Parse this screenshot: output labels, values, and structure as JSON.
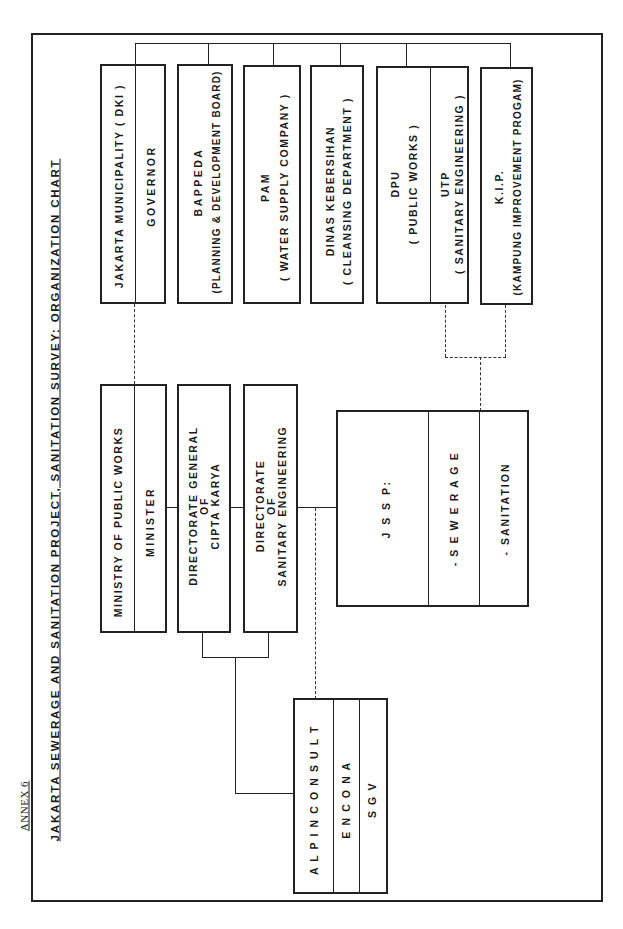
{
  "document": {
    "annex_label": "ANNEX 6",
    "title": "JAKARTA  SEWERAGE  AND  SANITATION  PROJECT, SANITATION  SURVEY: ORGANIZATION  CHART"
  },
  "chart": {
    "orientation": "rotated 90° counter-clockwise",
    "top_row_agencies": [
      {
        "id": "dki",
        "line1": "JAKARTA  MUNICIPALITY  ( DKI )",
        "line2": "GOVERNOR"
      },
      {
        "id": "bappeda",
        "line1": "BAPPEDA",
        "line2": "(PLANNING & DEVELOPMENT BOARD)"
      },
      {
        "id": "pam",
        "line1": "PAM",
        "line2": "( WATER  SUPPLY  COMPANY )"
      },
      {
        "id": "dinas",
        "line1": "DINAS  KEBERSIHAN",
        "line2": "( CLEANSING  DEPARTMENT )"
      },
      {
        "id": "dpu",
        "line1": "DPU",
        "line2": "( PUBLIC  WORKS )",
        "sub_line1": "UTP",
        "sub_line2": "( SANITARY  ENGINEERING )"
      },
      {
        "id": "kip",
        "line1": "K.I.P.",
        "line2": "(KAMPUNG IMPROVEMENT PROGAM)"
      }
    ],
    "ministry_row": [
      {
        "id": "ministry",
        "line1": "MINISTRY  OF  PUBLIC  WORKS",
        "line2": "MINISTER"
      },
      {
        "id": "dg_cipta_karya",
        "line1": "DIRECTORATE  GENERAL",
        "line2": "OF",
        "line3": "CIPTA  KARYA"
      },
      {
        "id": "dse",
        "line1": "DIRECTORATE",
        "line2": "OF",
        "line3": "SANITARY  ENGINEERING"
      }
    ],
    "jssp": {
      "title": "J S S P:",
      "item1": "- S E W E R A G E",
      "item2": "- SANITATION"
    },
    "consultants": {
      "line1": "A L P I N C O N S U L T",
      "line2": "E N C O N A",
      "line3": "S G V"
    }
  }
}
